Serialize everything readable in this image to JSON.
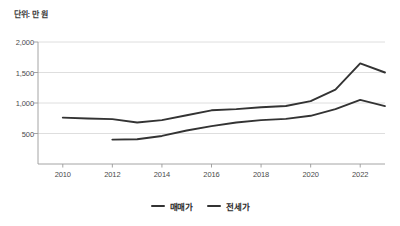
{
  "unit_note": "단위: 만 원",
  "legend": {
    "position": "bottom-center",
    "items": [
      {
        "label": "매매가",
        "color": "#333333"
      },
      {
        "label": "전세가",
        "color": "#333333"
      }
    ]
  },
  "axes": {
    "y_ticks": [
      "2,000",
      "1,500",
      "1,000",
      "500"
    ],
    "x_ticks": [
      "2010",
      "2012",
      "2014",
      "2016",
      "2018",
      "2020",
      "2022"
    ]
  },
  "chart_data": {
    "type": "line",
    "title": "",
    "subtitle": "",
    "xlabel": "",
    "ylabel": "단위: 만 원",
    "grid": true,
    "legend_position": "bottom-center",
    "xlim": [
      2009,
      2023
    ],
    "ylim": [
      0,
      2000
    ],
    "y_ticks": [
      500,
      1000,
      1500,
      2000
    ],
    "x_ticks": [
      2010,
      2012,
      2014,
      2016,
      2018,
      2020,
      2022
    ],
    "x": [
      2010,
      2011,
      2012,
      2013,
      2014,
      2015,
      2016,
      2017,
      2018,
      2019,
      2020,
      2021,
      2022,
      2023
    ],
    "series": [
      {
        "name": "매매가",
        "color": "#333333",
        "x": [
          2010,
          2011,
          2012,
          2013,
          2014,
          2015,
          2016,
          2017,
          2018,
          2019,
          2020,
          2021,
          2022,
          2023
        ],
        "values": [
          760,
          745,
          735,
          680,
          720,
          800,
          880,
          900,
          930,
          950,
          1030,
          1220,
          1650,
          1500
        ]
      },
      {
        "name": "전세가",
        "color": "#333333",
        "x": [
          2012,
          2013,
          2014,
          2015,
          2016,
          2017,
          2018,
          2019,
          2020,
          2021,
          2022,
          2023
        ],
        "values": [
          400,
          405,
          460,
          550,
          620,
          680,
          720,
          740,
          790,
          900,
          1050,
          950
        ]
      }
    ]
  }
}
